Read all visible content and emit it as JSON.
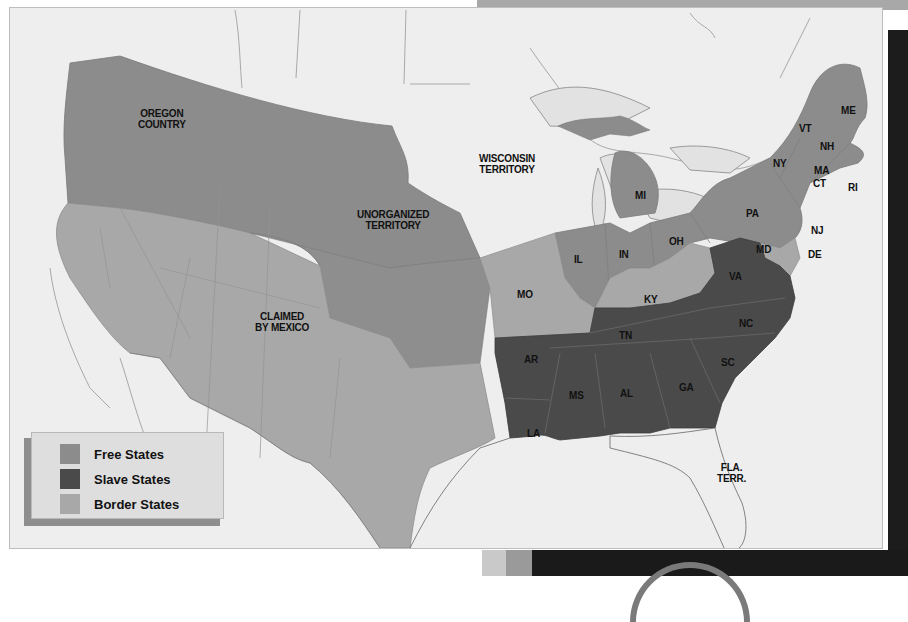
{
  "map": {
    "regions": [
      {
        "name": "OREGON COUNTRY",
        "category": "free"
      },
      {
        "name": "UNORGANIZED TERRITORY",
        "category": "free"
      },
      {
        "name": "WISCONSIN TERRITORY",
        "category": "none"
      },
      {
        "name": "CLAIMED BY MEXICO",
        "category": "border"
      },
      {
        "name": "FLA. TERR.",
        "category": "none"
      }
    ],
    "labels": {
      "oregon": "OREGON\nCOUNTRY",
      "oregon_l1": "OREGON",
      "oregon_l2": "COUNTRY",
      "unorganized_l1": "UNORGANIZED",
      "unorganized_l2": "TERRITORY",
      "wisconsin_l1": "WISCONSIN",
      "wisconsin_l2": "TERRITORY",
      "mexico_l1": "CLAIMED",
      "mexico_l2": "BY MEXICO",
      "florida_l1": "FLA.",
      "florida_l2": "TERR."
    },
    "states": {
      "ME": "ME",
      "VT": "VT",
      "NH": "NH",
      "NY": "NY",
      "MA": "MA",
      "CT": "CT",
      "RI": "RI",
      "PA": "PA",
      "NJ": "NJ",
      "DE": "DE",
      "MD": "MD",
      "MI": "MI",
      "OH": "OH",
      "IN": "IN",
      "IL": "IL",
      "MO": "MO",
      "KY": "KY",
      "VA": "VA",
      "NC": "NC",
      "SC": "SC",
      "TN": "TN",
      "GA": "GA",
      "AL": "AL",
      "MS": "MS",
      "AR": "AR",
      "LA": "LA"
    },
    "categories": {
      "free": [
        "ME",
        "VT",
        "NH",
        "NY",
        "MA",
        "CT",
        "RI",
        "PA",
        "NJ",
        "OH",
        "IN",
        "IL",
        "MI",
        "OREGON COUNTRY",
        "UNORGANIZED TERRITORY"
      ],
      "slave": [
        "VA",
        "NC",
        "SC",
        "GA",
        "AL",
        "MS",
        "TN",
        "AR",
        "LA"
      ],
      "border": [
        "MO",
        "KY",
        "MD",
        "DE",
        "CLAIMED BY MEXICO"
      ]
    }
  },
  "legend": {
    "items": [
      {
        "label": "Free States",
        "color": "#8c8c8c"
      },
      {
        "label": "Slave States",
        "color": "#4a4a4a"
      },
      {
        "label": "Border States",
        "color": "#a8a8a8"
      }
    ]
  },
  "colors": {
    "free": "#8c8c8c",
    "slave": "#4a4a4a",
    "border": "#a8a8a8",
    "unclaimed": "#eeeeee",
    "water": "#eeeeee"
  }
}
